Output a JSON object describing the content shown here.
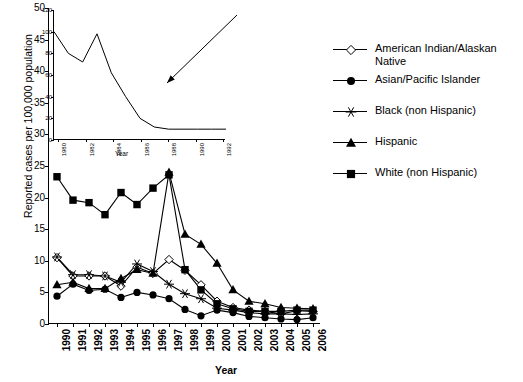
{
  "chart_data": {
    "type": "line",
    "title": "",
    "xlabel": "Year",
    "ylabel": "Reported cases per 100,000 population",
    "categories": [
      "1990",
      "1991",
      "1992",
      "1993",
      "1994",
      "1995",
      "1996",
      "1997",
      "1998",
      "1999",
      "2000",
      "2001",
      "2002",
      "2003",
      "2004",
      "2005",
      "2006"
    ],
    "ylim": [
      0,
      50
    ],
    "yticks": [
      0,
      5,
      10,
      15,
      20,
      25,
      30,
      35,
      40,
      45,
      50
    ],
    "grid": false,
    "legend_position": "right",
    "series": [
      {
        "name": "American Indian/Alaskan Native",
        "marker": "open-diamond",
        "values": [
          10.5,
          7.6,
          7.6,
          7.6,
          6.0,
          9.0,
          8.0,
          10.2,
          8.5,
          6.2,
          3.6,
          2.6,
          2.2,
          2.0,
          1.6,
          2.1,
          2.0
        ]
      },
      {
        "name": "Asian/Pacific Islander",
        "marker": "filled-circle",
        "values": [
          4.4,
          6.3,
          5.3,
          5.5,
          4.2,
          5.0,
          4.6,
          4.0,
          2.3,
          1.3,
          2.2,
          1.8,
          1.2,
          1.0,
          0.8,
          0.7,
          1.0
        ]
      },
      {
        "name": "Black (non Hispanic)",
        "marker": "asterisk",
        "values": [
          10.6,
          7.8,
          7.8,
          7.6,
          6.6,
          9.5,
          8.3,
          6.3,
          4.8,
          4.0,
          2.5,
          2.2,
          1.8,
          1.6,
          1.6,
          1.5,
          1.6
        ]
      },
      {
        "name": "Hispanic",
        "marker": "filled-triangle",
        "values": [
          6.2,
          6.6,
          5.6,
          5.6,
          7.2,
          8.6,
          8.0,
          24.0,
          14.2,
          12.6,
          9.6,
          5.4,
          3.6,
          3.2,
          2.6,
          2.5,
          2.4
        ]
      },
      {
        "name": "White (non Hispanic)",
        "marker": "filled-square",
        "values": [
          23.3,
          19.6,
          19.2,
          17.3,
          20.8,
          18.9,
          21.5,
          23.6,
          8.6,
          5.4,
          3.2,
          2.4,
          2.0,
          2.0,
          2.0,
          2.2,
          2.2
        ]
      }
    ],
    "inset": {
      "type": "line",
      "xlabel": "Year",
      "ylim": [
        0,
        120
      ],
      "yticks": [
        0,
        20,
        40,
        60,
        80,
        100,
        120
      ],
      "categories": [
        "1980",
        "1982",
        "1984",
        "1986",
        "1988",
        "1990",
        "1992"
      ],
      "values": [
        100,
        80,
        72,
        98,
        62,
        40,
        20,
        12,
        10,
        10,
        10,
        10,
        10
      ]
    },
    "annotation": "arrow from inset to 1996 data point"
  },
  "axes": {
    "ylabel": "Reported cases per 100,000 population",
    "xlabel": "Year",
    "yticks": [
      "0",
      "5",
      "10",
      "15",
      "20",
      "25",
      "30",
      "35",
      "40",
      "45",
      "50"
    ],
    "xticks": [
      "1990",
      "1991",
      "1992",
      "1993",
      "1994",
      "1995",
      "1996",
      "1997",
      "1998",
      "1999",
      "2000",
      "2001",
      "2002",
      "2003",
      "2004",
      "2005",
      "2006"
    ]
  },
  "inset_axes": {
    "xlabel": "Year",
    "yticks": [
      "0",
      "20",
      "40",
      "60",
      "80",
      "100",
      "120"
    ],
    "xticks": [
      "1980",
      "1982",
      "1984",
      "1986",
      "1988",
      "1990",
      "1992"
    ]
  },
  "legend": {
    "items": [
      {
        "label": "American Indian/Alaskan Native",
        "marker": "open-diamond"
      },
      {
        "label": "Asian/Pacific Islander",
        "marker": "filled-circle"
      },
      {
        "label": "Black (non Hispanic)",
        "marker": "asterisk"
      },
      {
        "label": "Hispanic",
        "marker": "filled-triangle"
      },
      {
        "label": "White (non Hispanic)",
        "marker": "filled-square"
      }
    ]
  }
}
